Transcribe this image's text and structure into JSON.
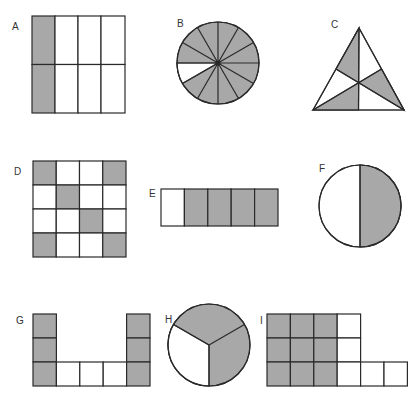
{
  "colors": {
    "shaded": "#a8a8a8",
    "unshaded": "#ffffff",
    "stroke": "#2a2a2a"
  },
  "figures": [
    {
      "label": "A",
      "shape": "grid",
      "rows": 2,
      "cols": 4,
      "shaded_cells": 2,
      "total_cells": 8,
      "description": "left column shaded"
    },
    {
      "label": "B",
      "shape": "circle",
      "sectors": 12,
      "shaded_sectors": 11,
      "description": "one sector unshaded"
    },
    {
      "label": "C",
      "shape": "triangle",
      "parts": 6,
      "shaded_parts": 3,
      "description": "equilateral triangle divided by medians, alternate parts shaded"
    },
    {
      "label": "D",
      "shape": "grid",
      "rows": 4,
      "cols": 4,
      "shaded_cells": 6,
      "total_cells": 16,
      "description": "four corners and two diagonal center cells shaded"
    },
    {
      "label": "E",
      "shape": "strip",
      "rows": 1,
      "cols": 5,
      "shaded_cells": 4,
      "total_cells": 5,
      "description": "first cell unshaded"
    },
    {
      "label": "F",
      "shape": "circle",
      "sectors": 2,
      "shaded_sectors": 1,
      "description": "right half shaded"
    },
    {
      "label": "G",
      "shape": "u-shape",
      "shaded_cells": 6,
      "total_cells": 9,
      "description": "two vertical columns of 3 shaded, 3 bottom middle unshaded"
    },
    {
      "label": "H",
      "shape": "circle",
      "sectors": 3,
      "shaded_sectors": 2,
      "description": "lower-left third unshaded"
    },
    {
      "label": "I",
      "shape": "l-shape",
      "shaded_cells": 9,
      "total_cells": 14,
      "description": "3x3 block shaded, extra column and two extra bottom cells unshaded"
    }
  ]
}
